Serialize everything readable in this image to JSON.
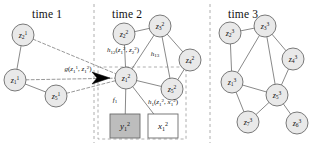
{
  "figure": {
    "width": 316,
    "height": 145,
    "background": "#ffffff",
    "node_fill": "#e9e9e9",
    "node_stroke": "#6b6b6b",
    "edge_stroke": "#6b6b6b",
    "divider_stroke": "#9a9a9a",
    "observed_box_fill": "#bdbdbd",
    "hidden_box_fill": "#ffffff",
    "arrow_fill": "#000000"
  },
  "panels": [
    {
      "id": "time1",
      "label": "time 1",
      "label_x": 32,
      "label_y": 8
    },
    {
      "id": "time2",
      "label": "time 2",
      "label_x": 112,
      "label_y": 8
    },
    {
      "id": "time3",
      "label": "time 3",
      "label_x": 228,
      "label_y": 8
    }
  ],
  "dividers": [
    {
      "id": "divider-1-2",
      "x": 94
    },
    {
      "id": "divider-2-3",
      "x": 210
    }
  ],
  "nodes": [
    {
      "id": "z2_1",
      "var": "z",
      "sub": "2",
      "sup": "1",
      "cx": 23,
      "cy": 35,
      "r": 11,
      "panel": "time1"
    },
    {
      "id": "z1_1",
      "var": "z",
      "sub": "1",
      "sup": "1",
      "cx": 15,
      "cy": 80,
      "r": 11,
      "panel": "time1"
    },
    {
      "id": "z5_1",
      "var": "z",
      "sub": "5",
      "sup": "1",
      "cx": 56,
      "cy": 96,
      "r": 11,
      "panel": "time1"
    },
    {
      "id": "z2_2",
      "var": "z",
      "sub": "2",
      "sup": "2",
      "cx": 124,
      "cy": 34,
      "r": 11,
      "panel": "time2"
    },
    {
      "id": "z3_2",
      "var": "z",
      "sub": "3",
      "sup": "2",
      "cx": 160,
      "cy": 26,
      "r": 11,
      "panel": "time2"
    },
    {
      "id": "z4_2",
      "var": "z",
      "sub": "4",
      "sup": "2",
      "cx": 190,
      "cy": 60,
      "r": 11,
      "panel": "time2"
    },
    {
      "id": "z5_2",
      "var": "z",
      "sub": "5",
      "sup": "2",
      "cx": 172,
      "cy": 89,
      "r": 11,
      "panel": "time2"
    },
    {
      "id": "z1_2",
      "var": "z",
      "sub": "1",
      "sup": "2",
      "cx": 126,
      "cy": 78,
      "r": 11,
      "panel": "time2"
    },
    {
      "id": "z2_3",
      "var": "z",
      "sub": "2",
      "sup": "3",
      "cx": 230,
      "cy": 33,
      "r": 11,
      "panel": "time3"
    },
    {
      "id": "z3_3",
      "var": "z",
      "sub": "3",
      "sup": "3",
      "cx": 265,
      "cy": 26,
      "r": 11,
      "panel": "time3"
    },
    {
      "id": "z4_3",
      "var": "z",
      "sub": "4",
      "sup": "3",
      "cx": 293,
      "cy": 59,
      "r": 11,
      "panel": "time3"
    },
    {
      "id": "z1_3",
      "var": "z",
      "sub": "1",
      "sup": "3",
      "cx": 232,
      "cy": 82,
      "r": 11,
      "panel": "time3"
    },
    {
      "id": "z5_3",
      "var": "z",
      "sub": "5",
      "sup": "3",
      "cx": 277,
      "cy": 95,
      "r": 11,
      "panel": "time3"
    },
    {
      "id": "z7_3",
      "var": "z",
      "sub": "7",
      "sup": "3",
      "cx": 248,
      "cy": 122,
      "r": 11,
      "panel": "time3"
    },
    {
      "id": "z6_3",
      "var": "z",
      "sub": "6",
      "sup": "3",
      "cx": 297,
      "cy": 123,
      "r": 11,
      "panel": "time3"
    }
  ],
  "edges": [
    {
      "id": "e-z2_1-z1_1",
      "from": "z2_1",
      "to": "z1_1",
      "style": "solid"
    },
    {
      "id": "e-z1_1-z5_1",
      "from": "z1_1",
      "to": "z5_1",
      "style": "solid"
    },
    {
      "id": "e-z2_2-z3_2",
      "from": "z2_2",
      "to": "z3_2",
      "style": "solid"
    },
    {
      "id": "e-z2_2-z1_2",
      "from": "z2_2",
      "to": "z1_2",
      "style": "solid"
    },
    {
      "id": "e-z3_2-z1_2",
      "from": "z3_2",
      "to": "z1_2",
      "style": "solid"
    },
    {
      "id": "e-z3_2-z4_2",
      "from": "z3_2",
      "to": "z4_2",
      "style": "solid"
    },
    {
      "id": "e-z3_2-z5_2",
      "from": "z3_2",
      "to": "z5_2",
      "style": "solid"
    },
    {
      "id": "e-z4_2-z5_2",
      "from": "z4_2",
      "to": "z5_2",
      "style": "solid"
    },
    {
      "id": "e-z1_2-z5_2",
      "from": "z1_2",
      "to": "z5_2",
      "style": "solid"
    },
    {
      "id": "e-z2_3-z3_3",
      "from": "z2_3",
      "to": "z3_3",
      "style": "solid"
    },
    {
      "id": "e-z2_3-z1_3",
      "from": "z2_3",
      "to": "z1_3",
      "style": "solid"
    },
    {
      "id": "e-z3_3-z1_3",
      "from": "z3_3",
      "to": "z1_3",
      "style": "solid"
    },
    {
      "id": "e-z3_3-z4_3",
      "from": "z3_3",
      "to": "z4_3",
      "style": "solid"
    },
    {
      "id": "e-z3_3-z5_3",
      "from": "z3_3",
      "to": "z5_3",
      "style": "solid"
    },
    {
      "id": "e-z4_3-z5_3",
      "from": "z4_3",
      "to": "z5_3",
      "style": "solid"
    },
    {
      "id": "e-z1_3-z5_3",
      "from": "z1_3",
      "to": "z5_3",
      "style": "solid"
    },
    {
      "id": "e-z1_3-z7_3",
      "from": "z1_3",
      "to": "z7_3",
      "style": "solid"
    },
    {
      "id": "e-z5_3-z7_3",
      "from": "z5_3",
      "to": "z7_3",
      "style": "solid"
    },
    {
      "id": "e-z5_3-z6_3",
      "from": "z5_3",
      "to": "z6_3",
      "style": "solid"
    }
  ],
  "cross_time_edges": [
    {
      "id": "e-z2_1-z1_2",
      "from": "z2_1",
      "to": "z1_2",
      "style": "dashed"
    },
    {
      "id": "e-z1_1-z1_2",
      "from": "z1_1",
      "to": "z1_2",
      "style": "dashed"
    },
    {
      "id": "e-z5_1-z1_2",
      "from": "z5_1",
      "to": "z1_2",
      "style": "dashed"
    }
  ],
  "observation_edges": [
    {
      "id": "e-z1_2-y1_2",
      "from": "z1_2",
      "to": "y1_2",
      "style": "solid"
    },
    {
      "id": "e-z1_2-x1_2",
      "from": "z1_2",
      "to": "x1_2",
      "style": "solid"
    }
  ],
  "boxes": [
    {
      "id": "y1_2",
      "var": "y",
      "sub": "1",
      "sup": "2",
      "x": 110,
      "y": 114,
      "w": 30,
      "h": 24,
      "fill": "#bdbdbd",
      "role": "observed"
    },
    {
      "id": "x1_2",
      "var": "x",
      "sub": "1",
      "sup": "2",
      "x": 148,
      "y": 114,
      "w": 30,
      "h": 24,
      "fill": "#ffffff",
      "role": "input"
    }
  ],
  "dashed_plate": {
    "id": "time2-plate",
    "x": 98,
    "y": 67,
    "w": 88,
    "h": 72
  },
  "arrow": {
    "id": "message-arrow",
    "x": 98,
    "y": 78,
    "points": "92,72 110,78 92,84 97,78"
  },
  "edge_labels": [
    {
      "id": "label-g",
      "x": 78,
      "y": 69,
      "parts": [
        {
          "t": "g",
          "k": "i"
        },
        {
          "t": "(",
          "k": "p"
        },
        {
          "t": "z",
          "k": "i"
        },
        {
          "t": "1",
          "k": "sub"
        },
        {
          "t": "1",
          "k": "sup"
        },
        {
          "t": ", ",
          "k": "p"
        },
        {
          "t": "z",
          "k": "i"
        },
        {
          "t": "1",
          "k": "sub"
        },
        {
          "t": "2",
          "k": "sup"
        },
        {
          "t": ")",
          "k": "p"
        }
      ]
    },
    {
      "id": "label-h12",
      "x": 123,
      "y": 50,
      "parts": [
        {
          "t": "h",
          "k": "i"
        },
        {
          "t": "12",
          "k": "sub"
        },
        {
          "t": "(",
          "k": "p"
        },
        {
          "t": "z",
          "k": "i"
        },
        {
          "t": "1",
          "k": "sub"
        },
        {
          "t": "2",
          "k": "sup"
        },
        {
          "t": ", ",
          "k": "p"
        },
        {
          "t": "z",
          "k": "i"
        },
        {
          "t": "2",
          "k": "sub"
        },
        {
          "t": "2",
          "k": "sup"
        },
        {
          "t": ")",
          "k": "p"
        }
      ]
    },
    {
      "id": "label-h13",
      "x": 155,
      "y": 54,
      "parts": [
        {
          "t": "h",
          "k": "i"
        },
        {
          "t": "13",
          "k": "sub"
        }
      ]
    },
    {
      "id": "label-f1",
      "x": 115,
      "y": 100,
      "parts": [
        {
          "t": "f",
          "k": "i"
        },
        {
          "t": "1",
          "k": "sub"
        }
      ]
    },
    {
      "id": "label-h1",
      "x": 163,
      "y": 102,
      "parts": [
        {
          "t": "h",
          "k": "i"
        },
        {
          "t": "1",
          "k": "sub"
        },
        {
          "t": "(",
          "k": "p"
        },
        {
          "t": "z",
          "k": "i"
        },
        {
          "t": "1",
          "k": "sub"
        },
        {
          "t": "2",
          "k": "sup"
        },
        {
          "t": ", ",
          "k": "p"
        },
        {
          "t": "x",
          "k": "i"
        },
        {
          "t": "1",
          "k": "sub"
        },
        {
          "t": "2",
          "k": "sup"
        },
        {
          "t": ")",
          "k": "p"
        }
      ]
    }
  ]
}
